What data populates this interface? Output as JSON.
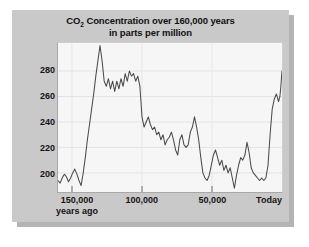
{
  "figure": {
    "panel_color": "#c9c9c9",
    "plot_background": "#f6f6f6",
    "line_color": "#4a4a4a",
    "text_color": "#141414"
  },
  "title": {
    "line1_prefix": "CO",
    "line1_subscript": "2",
    "line1_rest": " Concentration over 160,000 years",
    "line2": "in parts per million",
    "full": "CO2 Concentration over 160,000 years in parts per million"
  },
  "axis": {
    "y_ticks": [
      {
        "label": "200",
        "value": 200
      },
      {
        "label": "220",
        "value": 220
      },
      {
        "label": "240",
        "value": 240
      },
      {
        "label": "260",
        "value": 260
      },
      {
        "label": "280",
        "value": 280
      }
    ],
    "x_ticks": [
      {
        "label": "150,000",
        "sublabel": "years ago",
        "value": 150000
      },
      {
        "label": "100,000",
        "sublabel": "",
        "value": 100000
      },
      {
        "label": "50,000",
        "sublabel": "",
        "value": 50000
      },
      {
        "label": "Today",
        "sublabel": "",
        "value": 0
      }
    ]
  },
  "chart_data": {
    "type": "line",
    "title": "CO2 Concentration over 160,000 years in parts per million",
    "xlabel": "years ago",
    "ylabel": "parts per million",
    "xlim": [
      160000,
      0
    ],
    "ylim": [
      185,
      302
    ],
    "x_reversed": true,
    "grid": true,
    "legend": "none",
    "series": [
      {
        "name": "CO2 concentration",
        "color": "#4a4a4a",
        "x": [
          160000,
          158500,
          157000,
          155500,
          154000,
          152500,
          151000,
          149500,
          148000,
          146500,
          145000,
          143500,
          142000,
          140500,
          139000,
          137500,
          136000,
          134500,
          133000,
          131500,
          130000,
          128500,
          127000,
          125500,
          124000,
          122500,
          121000,
          119500,
          118000,
          116500,
          115000,
          113500,
          112000,
          110500,
          109000,
          107500,
          106000,
          104500,
          103000,
          101500,
          100000,
          98500,
          97000,
          95500,
          94000,
          92500,
          91000,
          89500,
          88000,
          86500,
          85000,
          83500,
          82000,
          80500,
          79000,
          77500,
          76000,
          74500,
          73000,
          71500,
          70000,
          68500,
          67000,
          65500,
          64000,
          62500,
          61000,
          59500,
          58000,
          56500,
          55000,
          53500,
          52000,
          50500,
          49000,
          47500,
          46000,
          44500,
          43000,
          41500,
          40000,
          38500,
          37000,
          35500,
          34000,
          32500,
          31000,
          29500,
          28000,
          26500,
          25000,
          23500,
          22000,
          20500,
          19000,
          17500,
          16000,
          14500,
          13000,
          11500,
          10000,
          8500,
          7000,
          5500,
          4000,
          2500,
          1500,
          800,
          300,
          0
        ],
        "y": [
          194,
          192,
          196,
          199,
          197,
          193,
          196,
          200,
          203,
          199,
          194,
          190,
          200,
          212,
          226,
          238,
          250,
          262,
          276,
          288,
          300,
          288,
          272,
          268,
          274,
          266,
          272,
          264,
          272,
          266,
          274,
          268,
          278,
          272,
          280,
          276,
          278,
          272,
          276,
          268,
          244,
          236,
          240,
          244,
          238,
          234,
          236,
          230,
          232,
          226,
          230,
          222,
          226,
          228,
          232,
          226,
          218,
          214,
          226,
          230,
          222,
          220,
          222,
          232,
          236,
          244,
          236,
          226,
          212,
          200,
          196,
          194,
          198,
          206,
          214,
          218,
          212,
          206,
          210,
          202,
          206,
          200,
          204,
          196,
          188,
          198,
          206,
          212,
          210,
          214,
          224,
          216,
          204,
          200,
          198,
          196,
          194,
          196,
          194,
          196,
          206,
          230,
          250,
          258,
          262,
          256,
          260,
          268,
          276,
          280
        ]
      }
    ]
  }
}
